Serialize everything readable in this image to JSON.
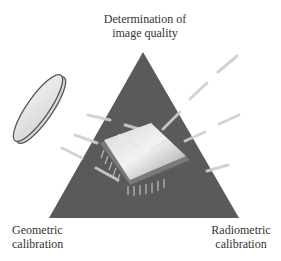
{
  "diagram": {
    "type": "triangle-concept-diagram",
    "vertices": {
      "top": {
        "line1": "Determination of",
        "line2": "image quality"
      },
      "bottom_left": {
        "line1": "Geometric",
        "line2": "calibration"
      },
      "bottom_right": {
        "line1": "Radiometric",
        "line2": "calibration"
      }
    },
    "center_illustration": "image-sensor-chip",
    "side_illustration": "lens-filter-disc",
    "colors": {
      "triangle": "#5a5a5a",
      "rays": "#c8c8c8",
      "text": "#333333"
    }
  }
}
